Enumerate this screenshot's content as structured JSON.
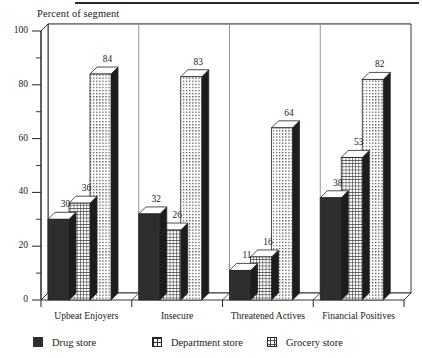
{
  "axis_title": "Percent of segment",
  "legend": {
    "items": [
      {
        "label": "Drug store",
        "swatch": "solid-dark-square-icon"
      },
      {
        "label": "Department store",
        "swatch": "grid-hatch-square-icon"
      },
      {
        "label": "Grocery store",
        "swatch": "dotted-square-icon"
      }
    ]
  },
  "colors": {
    "drug_store": "#2e2e2e",
    "department_store": "#ffffff",
    "grocery_store": "#ffffff",
    "outline": "#232323",
    "side_face": "#1d1d1d",
    "gridline": "#8a8a8a",
    "rule": "#2b2b2b"
  },
  "chart_data": {
    "type": "bar",
    "title": "",
    "xlabel": "",
    "ylabel": "Percent of segment",
    "ylim": [
      0,
      100
    ],
    "ytick_labels": [
      "0",
      "20",
      "40",
      "60",
      "80",
      "100"
    ],
    "ytick_values": [
      0,
      20,
      40,
      60,
      80,
      100
    ],
    "minor_tick_step": 10,
    "grid": true,
    "grid_axis": "y",
    "legend_position": "bottom",
    "three_d": true,
    "categories": [
      "Upbeat Enjoyers",
      "Insecure",
      "Threatened Actives",
      "Financial Positives"
    ],
    "series": [
      {
        "name": "Drug store",
        "values": [
          30,
          32,
          11,
          38
        ]
      },
      {
        "name": "Department store",
        "values": [
          36,
          26,
          16,
          53
        ]
      },
      {
        "name": "Grocery store",
        "values": [
          84,
          83,
          64,
          82
        ]
      }
    ],
    "data_labels": [
      {
        "category": "Upbeat Enjoyers",
        "series": "Drug store",
        "value": 30
      },
      {
        "category": "Upbeat Enjoyers",
        "series": "Department store",
        "value": 36
      },
      {
        "category": "Upbeat Enjoyers",
        "series": "Grocery store",
        "value": 84
      },
      {
        "category": "Insecure",
        "series": "Drug store",
        "value": 32
      },
      {
        "category": "Insecure",
        "series": "Department store",
        "value": 26
      },
      {
        "category": "Insecure",
        "series": "Grocery store",
        "value": 83
      },
      {
        "category": "Threatened Actives",
        "series": "Drug store",
        "value": 11
      },
      {
        "category": "Threatened Actives",
        "series": "Department store",
        "value": 16
      },
      {
        "category": "Threatened Actives",
        "series": "Grocery store",
        "value": 64
      },
      {
        "category": "Financial Positives",
        "series": "Drug store",
        "value": 38
      },
      {
        "category": "Financial Positives",
        "series": "Department store",
        "value": 53
      },
      {
        "category": "Financial Positives",
        "series": "Grocery store",
        "value": 82
      }
    ]
  }
}
